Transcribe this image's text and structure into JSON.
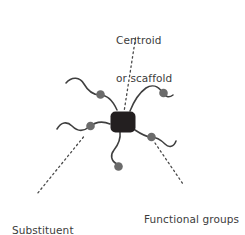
{
  "figure": {
    "background_color": "#ffffff",
    "width": 245,
    "height": 235
  },
  "colors": {
    "centroid": "#231f20",
    "arm_stroke": "#3f3f3f",
    "functional_group": "#6b6b6b",
    "leader_line": "#4a4a4a",
    "text": "#3c3c3c"
  },
  "labels": {
    "centroid": {
      "line1": "Centroid",
      "line2": "or scaffold"
    },
    "substituent": {
      "line1": "Substituent",
      "line2": "'arms'"
    },
    "functional": {
      "line1": "Functional groups"
    }
  },
  "diagram": {
    "centroid": {
      "name": "centroid-or-scaffold",
      "shape": "rounded-square",
      "x": 110.5,
      "y": 111.5,
      "width": 25,
      "height": 21,
      "corner_radius": 5
    },
    "arms": [
      {
        "name": "arm-upper-left",
        "path": "M 66 83 C 72 76 80 77 84 84 C 88 91 93 95 100 95 C 108 95 113 101 117 110",
        "functional_group": {
          "cx": 100.5,
          "cy": 94.5,
          "r": 4.3
        }
      },
      {
        "name": "arm-upper-right",
        "path": "M 130 111 C 134 101 139 93 146 88 C 152 84 158 86 162 92 C 165 97 169 98 173 95",
        "functional_group": {
          "cx": 163.5,
          "cy": 93.0,
          "r": 4.3
        }
      },
      {
        "name": "arm-left",
        "path": "M 57 129 C 61 122 67 121 72 126 C 77 131 83 132 89 127 C 95 122 103 121 110 124",
        "functional_group": {
          "cx": 90.5,
          "cy": 126.0,
          "r": 4.3
        }
      },
      {
        "name": "arm-lower-right",
        "path": "M 135 130 C 141 134 146 137 151 137 C 157 137 161 140 165 144 C 169 148 174 147 176 141",
        "functional_group": {
          "cx": 151.5,
          "cy": 137.0,
          "r": 4.3
        }
      },
      {
        "name": "arm-bottom",
        "path": "M 120 132 C 121 140 118 145 114 150 C 110 155 111 161 117 164",
        "functional_group": {
          "cx": 118.5,
          "cy": 166.5,
          "r": 4.3
        }
      }
    ],
    "leader_lines": [
      {
        "name": "leader-centroid",
        "x1": 135.5,
        "y1": 38,
        "x2": 124,
        "y2": 112
      },
      {
        "name": "leader-substituent",
        "x1": 83.5,
        "y1": 137,
        "x2": 37,
        "y2": 194
      },
      {
        "name": "leader-functional",
        "x1": 155,
        "y1": 143,
        "x2": 183,
        "y2": 184
      }
    ]
  }
}
